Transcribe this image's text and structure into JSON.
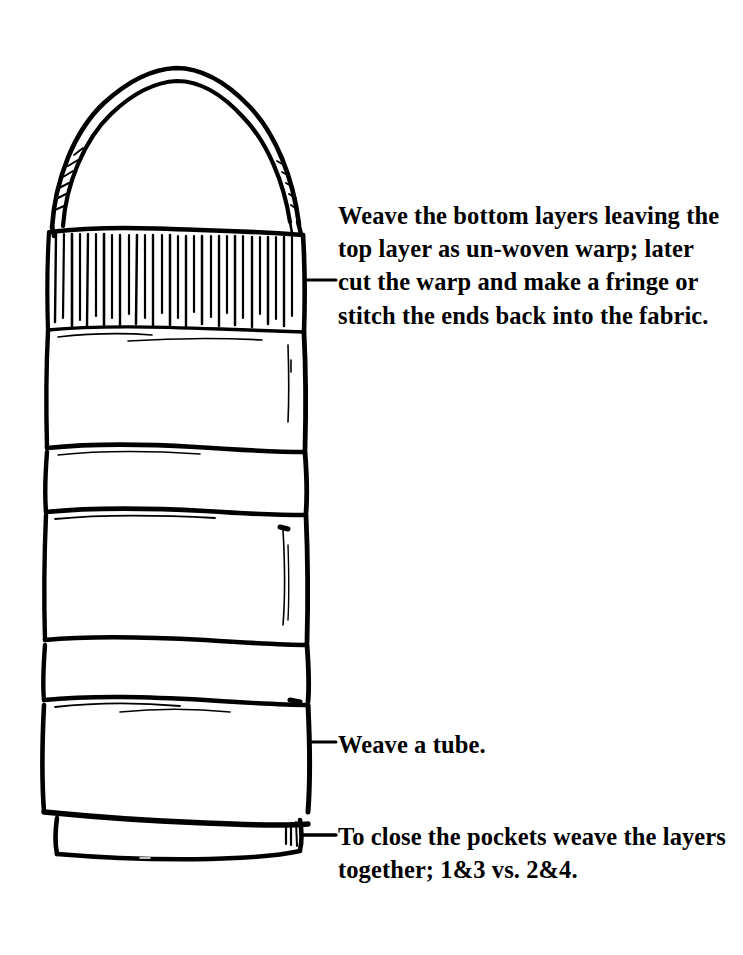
{
  "figure": {
    "background_color": "#ffffff",
    "ink_color": "#000000",
    "drawing": {
      "name": "woven-tube-bag",
      "description": "Hand-drawn line illustration of a four-layer woven tube with a pointed arch top strap, an unwoven warp fringe band near the top, three horizontal pocket divisions and a closed hem at the bottom.",
      "parts": [
        "arch-top-strap",
        "warp-fringe-band",
        "pocket-band-1",
        "pocket-band-2",
        "pocket-band-3",
        "bottom-hem"
      ]
    },
    "annotations": [
      {
        "id": "warp",
        "leader_y": 280,
        "text": "Weave the bottom layers leaving the top layer as un-woven warp; later cut the warp and make a fringe or stitch the ends back into the fabric.",
        "lines": [
          "Weave the bottom layers",
          "leaving the top layer as un-",
          "woven warp; later cut the",
          "warp and make a fringe or",
          "stitch the ends back into the",
          "fabric."
        ]
      },
      {
        "id": "tube",
        "leader_y": 742,
        "text": "Weave a tube.",
        "lines": [
          "Weave a tube."
        ]
      },
      {
        "id": "pockets",
        "leader_y": 835,
        "text": "To close the pockets weave the layers together; 1&3 vs. 2&4.",
        "lines": [
          "To close the pockets weave",
          "the layers together; 1&3 vs.",
          "2&4."
        ]
      }
    ]
  }
}
